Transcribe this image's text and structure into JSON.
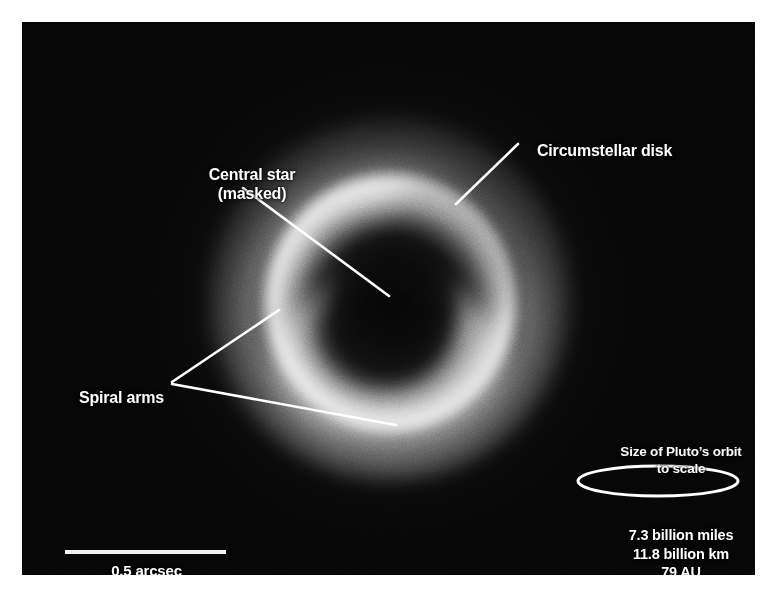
{
  "figure": {
    "kind": "annotated-astronomical-image",
    "background_color": "#ffffff",
    "plate_color": "#060606",
    "annotation_color": "#ffffff"
  },
  "annotations": {
    "circumstellar_disk": {
      "label": "Circumstellar disk",
      "leader": {
        "x1": 518,
        "y1": 144,
        "x2": 456,
        "y2": 204
      }
    },
    "central_star": {
      "line1": "Central star",
      "line2": "(masked)",
      "label": "Central star\n(masked)",
      "leader": {
        "x1": 243,
        "y1": 188,
        "x2": 389,
        "y2": 296
      }
    },
    "spiral_arms": {
      "label": "Spiral arms",
      "leader_vertex": {
        "x": 172,
        "y": 382
      },
      "leader_branch_upper": {
        "x": 279,
        "y": 310
      },
      "leader_branch_lower": {
        "x": 396,
        "y": 425
      }
    }
  },
  "scale_bar": {
    "caption": "0.5 arcsec",
    "length_px": 161,
    "bar_x": 43,
    "bar_y": 528
  },
  "pluto_orbit_key": {
    "title_line1": "Size of Pluto’s orbit",
    "title_line2": "to scale",
    "ellipse": {
      "cx": 658,
      "cy": 481,
      "rx": 80,
      "ry": 15
    },
    "measurements": [
      "7.3 billion miles",
      "11.8 billion km",
      "79 AU"
    ],
    "measurement_miles": "7.3 billion miles",
    "measurement_km": "11.8 billion km",
    "measurement_au": "79 AU"
  }
}
